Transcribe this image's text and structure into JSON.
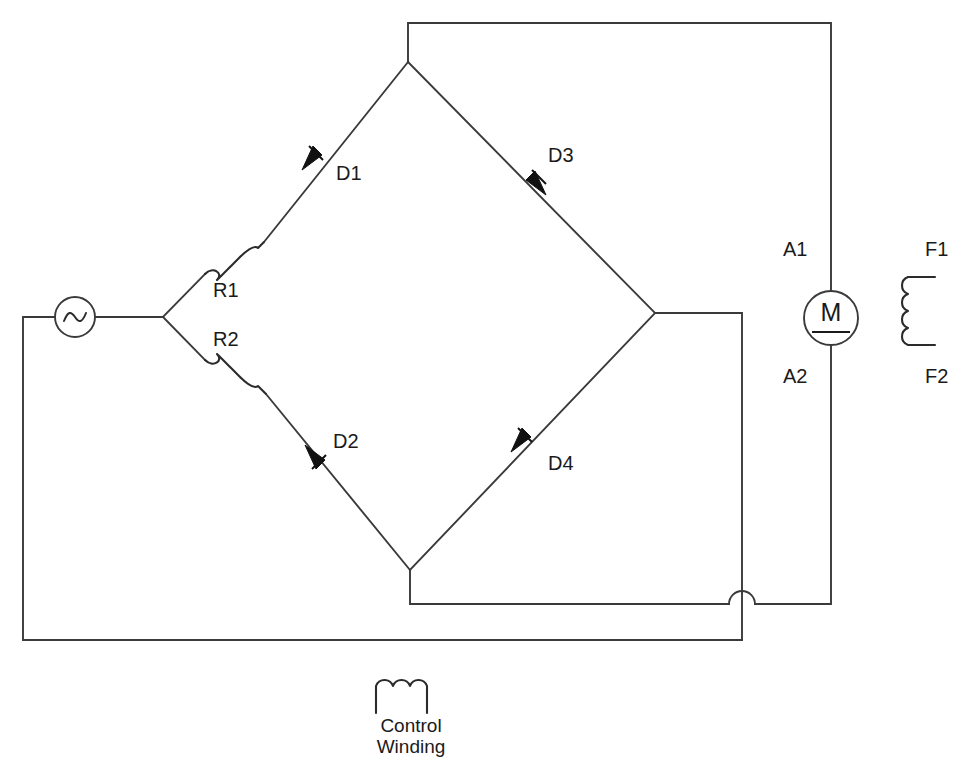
{
  "diagram": {
    "type": "electrical-schematic",
    "background_color": "#ffffff",
    "line_color": "#3a3a3a",
    "text_color": "#1a1a1a",
    "width": 972,
    "height": 769
  },
  "labels": {
    "d1": "D1",
    "d2": "D2",
    "d3": "D3",
    "d4": "D4",
    "r1": "R1",
    "r2": "R2",
    "a1": "A1",
    "a2": "A2",
    "f1": "F1",
    "f2": "F2",
    "motor": "M",
    "control_winding_line1": "Control",
    "control_winding_line2": "Winding"
  },
  "components": [
    {
      "id": "ac-source",
      "kind": "ac-voltage-source",
      "label": "",
      "symbol": "sine-in-circle"
    },
    {
      "id": "r1",
      "kind": "coil-reactor",
      "label": "R1",
      "symbol": "coil-3-turn"
    },
    {
      "id": "r2",
      "kind": "coil-reactor",
      "label": "R2",
      "symbol": "coil-3-turn"
    },
    {
      "id": "d1",
      "kind": "diode",
      "label": "D1",
      "direction": "up-right"
    },
    {
      "id": "d2",
      "kind": "diode",
      "label": "D2",
      "direction": "down-right"
    },
    {
      "id": "d3",
      "kind": "diode",
      "label": "D3",
      "direction": "up-left"
    },
    {
      "id": "d4",
      "kind": "diode",
      "label": "D4",
      "direction": "up-right"
    },
    {
      "id": "motor",
      "kind": "dc-motor",
      "label": "M",
      "terminals": [
        "A1",
        "A2"
      ]
    },
    {
      "id": "field-winding",
      "kind": "winding",
      "label": "",
      "terminals": [
        "F1",
        "F2"
      ]
    },
    {
      "id": "control-winding",
      "kind": "winding",
      "label": "Control Winding",
      "symbol": "coil-3-hump"
    }
  ]
}
